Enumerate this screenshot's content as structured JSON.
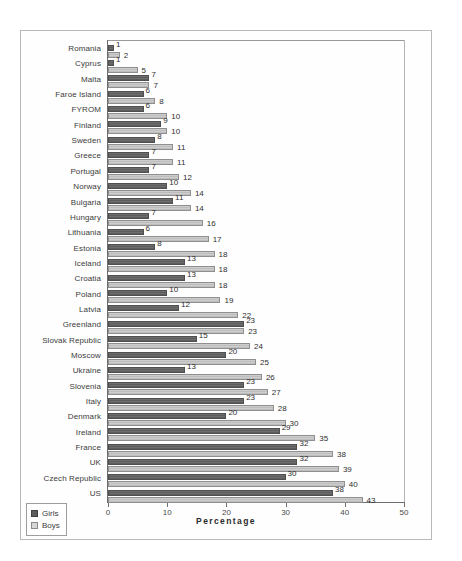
{
  "chart_data": {
    "type": "bar",
    "orientation": "horizontal",
    "title": "",
    "xlabel": "Percentage",
    "ylabel": "",
    "xlim": [
      0,
      50
    ],
    "xticks": [
      0,
      10,
      20,
      30,
      40,
      50
    ],
    "grid": false,
    "legend_position": "bottom-left",
    "categories": [
      "Romania",
      "Cyprus",
      "Malta",
      "Faroe Island",
      "FYROM",
      "Finland",
      "Sweden",
      "Greece",
      "Portugal",
      "Norway",
      "Bulgaria",
      "Hungary",
      "Lithuania",
      "Estonia",
      "Iceland",
      "Croatia",
      "Poland",
      "Latvia",
      "Greenland",
      "Slovak Republic",
      "Moscow",
      "Ukraine",
      "Slovenia",
      "Italy",
      "Denmark",
      "Ireland",
      "France",
      "UK",
      "Czech Republic",
      "US"
    ],
    "series": [
      {
        "name": "Girls",
        "color": "#5d5d5d",
        "values": [
          1,
          1,
          7,
          6,
          6,
          9,
          8,
          7,
          7,
          10,
          11,
          7,
          6,
          8,
          13,
          13,
          10,
          12,
          23,
          15,
          20,
          13,
          23,
          23,
          20,
          29,
          32,
          32,
          30,
          38
        ]
      },
      {
        "name": "Boys",
        "color": "#cdcdcd",
        "values": [
          2,
          5,
          7,
          8,
          10,
          10,
          11,
          11,
          12,
          14,
          14,
          16,
          17,
          18,
          18,
          18,
          19,
          22,
          23,
          24,
          25,
          26,
          27,
          28,
          30,
          35,
          38,
          39,
          40,
          43
        ]
      }
    ]
  },
  "legend": {
    "items": [
      {
        "label": "Girls"
      },
      {
        "label": "Boys"
      }
    ]
  },
  "caption": {
    "text": ""
  }
}
